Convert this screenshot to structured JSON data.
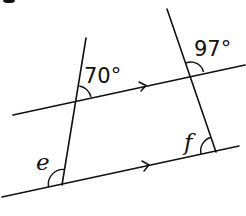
{
  "diagram": {
    "parallel_lines": [
      {
        "id": "upper",
        "from": [
          13,
          115
        ],
        "to": [
          245,
          65
        ],
        "arrow_marker": true
      },
      {
        "id": "lower",
        "from": [
          2,
          197
        ],
        "to": [
          239,
          146
        ],
        "arrow_marker": true
      }
    ],
    "transversals": [
      {
        "id": "left",
        "from": [
          86,
          38
        ],
        "to": [
          62,
          185
        ]
      },
      {
        "id": "right",
        "from": [
          167,
          9
        ],
        "to": [
          216,
          152
        ]
      }
    ],
    "angles": [
      {
        "id": "angle-70",
        "label": "70°",
        "at": "left transversal / upper line",
        "known": true
      },
      {
        "id": "angle-97",
        "label": "97°",
        "at": "right transversal / upper line",
        "known": true
      },
      {
        "id": "angle-e",
        "label": "e",
        "at": "left transversal / lower line",
        "known": false
      },
      {
        "id": "angle-f",
        "label": "f",
        "at": "right transversal / lower line",
        "known": false
      }
    ]
  },
  "labels": {
    "angle_70": "70°",
    "angle_97": "97°",
    "angle_e": "e",
    "angle_f": "f"
  }
}
